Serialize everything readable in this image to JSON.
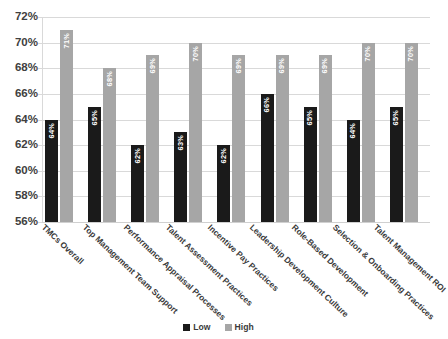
{
  "chart_data": {
    "type": "bar",
    "title": "",
    "xlabel": "",
    "ylabel": "",
    "ylim": [
      56,
      72
    ],
    "ytick_step": 2,
    "ytick_labels": [
      "72%",
      "70%",
      "68%",
      "66%",
      "64%",
      "62%",
      "60%",
      "58%",
      "56%"
    ],
    "grid": true,
    "legend_position": "bottom",
    "value_suffix": "%",
    "categories": [
      "TMCs Overall",
      "Top Management Team Support",
      "Performance Appraisal Processes",
      "Talent Assessment Practices",
      "Incentive Pay Practices",
      "Leadership Development Culture",
      "Role-Based Development",
      "Selection & Onboarding Practices",
      "Talent Management ROI"
    ],
    "series": [
      {
        "name": "Low",
        "color": "#1a1a1a",
        "values": [
          64,
          65,
          62,
          63,
          62,
          66,
          65,
          64,
          65
        ],
        "labels": [
          "64%",
          "65%",
          "62%",
          "63%",
          "62%",
          "66%",
          "65%",
          "64%",
          "65%"
        ]
      },
      {
        "name": "High",
        "color": "#a6a6a6",
        "values": [
          71,
          68,
          69,
          70,
          69,
          69,
          69,
          70,
          70
        ],
        "labels": [
          "71%",
          "68%",
          "69%",
          "70%",
          "69%",
          "69%",
          "69%",
          "70%",
          "70%"
        ]
      }
    ]
  },
  "legend": {
    "items": [
      {
        "label": "Low",
        "color": "#1a1a1a"
      },
      {
        "label": "High",
        "color": "#a6a6a6"
      }
    ]
  }
}
